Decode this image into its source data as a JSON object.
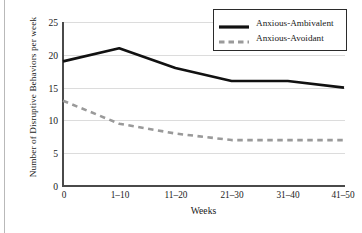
{
  "chart_data": {
    "type": "line",
    "title": "",
    "xlabel": "Weeks",
    "ylabel": "Number of Disruptive Behaviors per week",
    "categories": [
      "0",
      "1–10",
      "11–20",
      "21–30",
      "31–40",
      "41–50"
    ],
    "yticks": [
      "0",
      "5",
      "10",
      "15",
      "20",
      "25"
    ],
    "ylim": [
      0,
      25
    ],
    "grid": "horizontal",
    "legend_position": "top-right",
    "series": [
      {
        "name": "Anxious-Ambivalent",
        "values": [
          19,
          21,
          18,
          16,
          16,
          15
        ],
        "color": "#111111",
        "style": "solid",
        "width": 2.6
      },
      {
        "name": "Anxious-Avoidant",
        "values": [
          13,
          9.5,
          8,
          7,
          7,
          7
        ],
        "color": "#9a9a9a",
        "style": "dashed",
        "width": 2.6
      }
    ]
  },
  "colors": {
    "axis": "#4a4a4a",
    "grid": "#dcdcdc",
    "legend_border": "#2b2b2b",
    "page_edge": "#b9b9b9",
    "text": "#1a1a1a"
  }
}
